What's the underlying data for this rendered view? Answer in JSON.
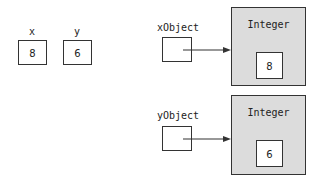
{
  "primitives": [
    {
      "name": "x",
      "value": "8"
    },
    {
      "name": "y",
      "value": "6"
    }
  ],
  "references": [
    {
      "name": "xObject",
      "target_class": "Integer",
      "target_value": "8"
    },
    {
      "name": "yObject",
      "target_class": "Integer",
      "target_value": "6"
    }
  ],
  "colors": {
    "object_fill": "#dcdcdc",
    "stroke": "#333333",
    "background": "#ffffff"
  }
}
